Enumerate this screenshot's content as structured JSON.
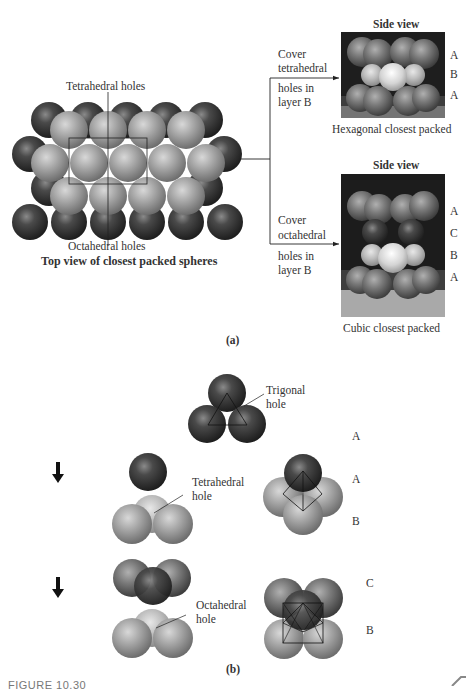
{
  "part_a": {
    "label": "(a)",
    "top_view": {
      "label_tetrahedral": "Tetrahedral holes",
      "label_octahedral": "Octahedral holes",
      "caption": "Top view of closest packed spheres"
    },
    "branch_hcp": {
      "instruction_line1": "Cover",
      "instruction_line2": "tetrahedral",
      "instruction_line3": "holes in",
      "instruction_line4": "layer B",
      "side_view_title": "Side view",
      "layers": [
        "A",
        "B",
        "A"
      ],
      "caption": "Hexagonal closest packed"
    },
    "branch_ccp": {
      "instruction_line1": "Cover",
      "instruction_line2": "octahedral",
      "instruction_line3": "holes in",
      "instruction_line4": "layer B",
      "side_view_title": "Side view",
      "layers": [
        "A",
        "C",
        "B",
        "A"
      ],
      "caption": "Cubic closest packed"
    }
  },
  "part_b": {
    "label": "(b)",
    "trigonal": {
      "label_line1": "Trigonal",
      "label_line2": "hole",
      "layer": "A"
    },
    "tetrahedral": {
      "label_line1": "Tetrahedral",
      "label_line2": "hole",
      "layers": [
        "A",
        "B"
      ]
    },
    "octahedral": {
      "label_line1": "Octahedral",
      "label_line2": "hole",
      "layers": [
        "C",
        "B"
      ]
    }
  },
  "footer": {
    "figure_number": "FIGURE 10.30"
  },
  "colors": {
    "dark_sphere": "#3a3a3a",
    "light_sphere": "#9a9a9a",
    "photo_bg": "#1c1c1c",
    "line": "#222222"
  }
}
